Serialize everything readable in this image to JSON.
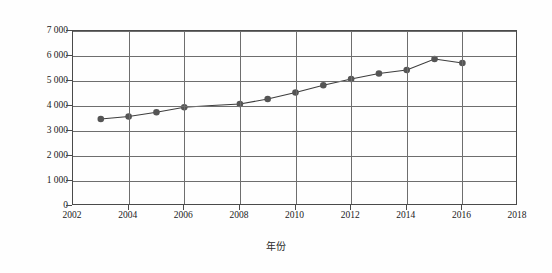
{
  "chart_data": {
    "type": "line",
    "title": "",
    "subtitle": "",
    "xlabel": "年份",
    "ylabel": "黄瓜总产量（万吨）",
    "x": [
      2003,
      2004,
      2005,
      2006,
      2008,
      2009,
      2010,
      2011,
      2012,
      2013,
      2014,
      2015,
      2016
    ],
    "categories": [
      "2003",
      "2004",
      "2005",
      "2006",
      "2008",
      "2009",
      "2010",
      "2011",
      "2012",
      "2013",
      "2014",
      "2015",
      "2016"
    ],
    "values": [
      3480,
      3580,
      3750,
      3950,
      4080,
      4280,
      4540,
      4830,
      5080,
      5300,
      5440,
      5880,
      5720
    ],
    "series": [
      {
        "name": "黄瓜总产量（万吨）",
        "marker": "filled-circle",
        "color": "#555555",
        "points": [
          {
            "x": 2003,
            "y": 3480
          },
          {
            "x": 2004,
            "y": 3580
          },
          {
            "x": 2005,
            "y": 3750
          },
          {
            "x": 2006,
            "y": 3950
          },
          {
            "x": 2007,
            "y": 4020
          },
          {
            "x": 2008,
            "y": 4080
          },
          {
            "x": 2009,
            "y": 4280
          },
          {
            "x": 2010,
            "y": 4540
          },
          {
            "x": 2011,
            "y": 4830
          },
          {
            "x": 2012,
            "y": 5080
          },
          {
            "x": 2013,
            "y": 5300
          },
          {
            "x": 2014,
            "y": 5440
          },
          {
            "x": 2015,
            "y": 5880
          },
          {
            "x": 2016,
            "y": 5720
          }
        ]
      }
    ],
    "xlim": [
      2002,
      2018
    ],
    "ylim": [
      0,
      7000
    ],
    "xticks": [
      "2002",
      "2004",
      "2006",
      "2008",
      "2010",
      "2012",
      "2014",
      "2016",
      "2018"
    ],
    "xtick_values": [
      2002,
      2004,
      2006,
      2008,
      2010,
      2012,
      2014,
      2016,
      2018
    ],
    "yticks": [
      "0",
      "1 000",
      "2 000",
      "3 000",
      "4 000",
      "5 000",
      "6 000",
      "7 000"
    ],
    "ytick_values": [
      0,
      1000,
      2000,
      3000,
      4000,
      5000,
      6000,
      7000
    ],
    "grid": "both",
    "legend": "none",
    "line_color": "#3d3d3d",
    "marker_color": "#555555",
    "frame_color": "#4a4a4a",
    "grid_color": "#6e6e6e",
    "background": "#ffffff"
  }
}
